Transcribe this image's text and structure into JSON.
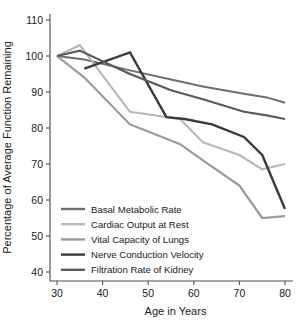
{
  "chart_data": {
    "type": "line",
    "title": "",
    "xlabel": "Age in Years",
    "ylabel": "Percentage of Average Function Remaining",
    "xlim": [
      26,
      84
    ],
    "ylim": [
      36,
      114
    ],
    "xticks": [
      30,
      40,
      50,
      60,
      70,
      80
    ],
    "yticks": [
      40,
      50,
      60,
      70,
      80,
      90,
      100,
      110
    ],
    "xtick_labels": [
      "30",
      "40",
      "50",
      "60",
      "70",
      "80"
    ],
    "ytick_labels": [
      "40",
      "50",
      "60",
      "70",
      "80",
      "90",
      "100",
      "110"
    ],
    "grid": false,
    "legend_position": "lower-left-inside",
    "series": [
      {
        "name": "Basal Metabolic Rate",
        "color": "#6e6e6e",
        "width": 2.0,
        "x": [
          30,
          36,
          46,
          55,
          62,
          71,
          76,
          80
        ],
        "values": [
          100,
          99,
          96,
          93.5,
          91.5,
          89.5,
          88.5,
          87
        ]
      },
      {
        "name": "Cardiac Output at Rest",
        "color": "#b8b8b8",
        "width": 2.2,
        "x": [
          30,
          35,
          46,
          57,
          62,
          70,
          75,
          80
        ],
        "values": [
          100,
          103,
          84.5,
          82.5,
          76,
          72.5,
          68.5,
          70
        ]
      },
      {
        "name": "Vital Capacity of Lungs",
        "color": "#9a9a9a",
        "width": 2.2,
        "x": [
          30,
          36,
          46,
          50,
          57,
          62,
          70,
          75,
          80
        ],
        "values": [
          100,
          94,
          81,
          79,
          75.5,
          71,
          64,
          55,
          55.5
        ]
      },
      {
        "name": "Nerve Conduction Velocity",
        "color": "#3a3a3a",
        "width": 2.4,
        "x": [
          36,
          46,
          54,
          58,
          64,
          71,
          75,
          80
        ],
        "values": [
          96.5,
          101,
          83,
          82.5,
          81,
          77.5,
          72.5,
          57.5
        ]
      },
      {
        "name": "Filtration Rate of Kidney",
        "color": "#5a5a5a",
        "width": 2.2,
        "x": [
          30,
          35,
          46,
          55,
          62,
          71,
          76,
          80
        ],
        "values": [
          100,
          101.5,
          95,
          90.5,
          88,
          84.5,
          83.5,
          82.5
        ]
      }
    ]
  }
}
